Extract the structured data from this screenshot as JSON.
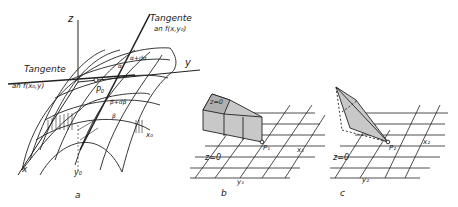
{
  "panel_a": {
    "caption": "a",
    "axis_z": "z",
    "axis_y": "y",
    "axis_x": "x",
    "tangent1_title": "Tangente",
    "tangent1_sub": "an f(x,y₀)",
    "tangent2_title": "Tangente",
    "tangent2_sub": "an f(x₀,y)",
    "point": "P₀",
    "alpha": "α",
    "alpha_d": "α+dα",
    "beta": "β",
    "beta_d": "β+dβ",
    "x0": "x₀",
    "y0": "y₀"
  },
  "panel_b": {
    "caption": "b",
    "top_label": "z=0",
    "plane_label": "z=0",
    "point": "P₁",
    "x_label": "x₁",
    "y_label": "y₁"
  },
  "panel_c": {
    "caption": "c",
    "plane_label": "z=0",
    "point": "P₂",
    "x_label": "x₂",
    "y_label": "y₂"
  },
  "colors": {
    "ink": "#222222",
    "shade": "#c8c8c8"
  }
}
